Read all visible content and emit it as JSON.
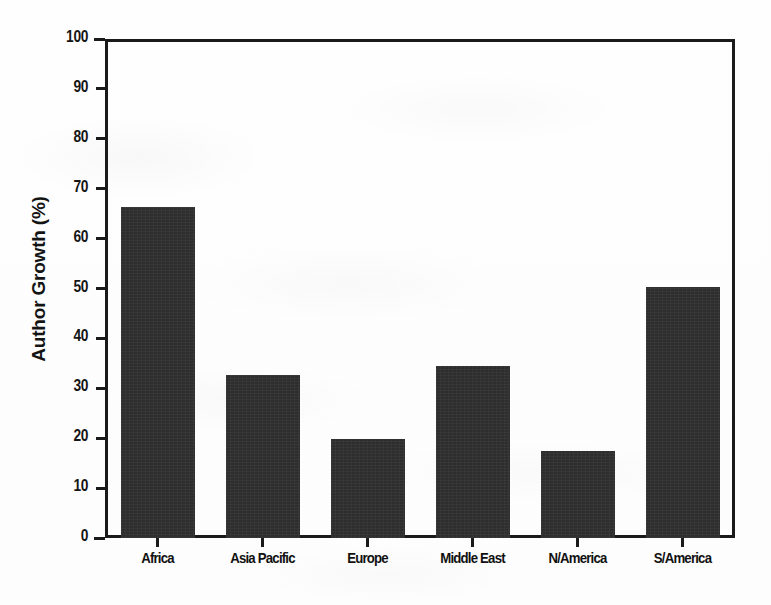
{
  "chart_data": {
    "type": "bar",
    "title": "",
    "subtitle": "",
    "xlabel": "",
    "ylabel": "Author Growth (%)",
    "categories": [
      "Africa",
      "Asia Pacific",
      "Europe",
      "Middle East",
      "N/America",
      "S/America"
    ],
    "values": [
      66.4,
      32.6,
      19.8,
      34.5,
      17.4,
      50.4
    ],
    "ylim": [
      0,
      100
    ],
    "ytick_labels": [
      "0",
      "10",
      "20",
      "30",
      "40",
      "50",
      "60",
      "70",
      "80",
      "90",
      "100"
    ],
    "ytick_values": [
      0,
      10,
      20,
      30,
      40,
      50,
      60,
      70,
      80,
      90,
      100
    ],
    "grid": false,
    "legend": null,
    "bar_color": "#2e2e2e",
    "axis_color": "#1a1a1a",
    "background_color": "#ffffff"
  },
  "figure": {
    "ylabel_text": "Author Growth (%)"
  }
}
